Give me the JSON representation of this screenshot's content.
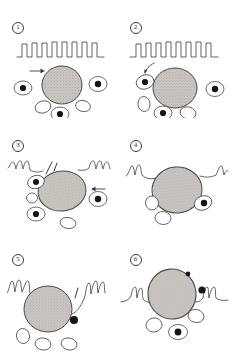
{
  "figure": {
    "type": "hand-drawn biological line illustration",
    "panel_count": 6,
    "grid": "2 columns x 3 rows",
    "background_color": "#ffffff",
    "ink_color": "#3c3a38",
    "cell_fill_color": "#c9c5c0",
    "nucleus_color": "#1a1a1a"
  },
  "panels": [
    {
      "id": "panel-1",
      "number_label": "1",
      "epithelium": {
        "present": true,
        "style": "crenellated",
        "position": "top",
        "teeth": 8,
        "note": "regular square-topped projections along a straight baseline"
      },
      "big_cell": {
        "present": true,
        "shape": "round",
        "texture": "stippled"
      },
      "arrow": {
        "present": true,
        "direction": "right",
        "position": "upper-left of big cell"
      },
      "small_cells": [
        {
          "position": "left",
          "nucleus": true
        },
        {
          "position": "right",
          "nucleus": true
        },
        {
          "position": "bottom-center",
          "nucleus": true
        }
      ],
      "blank_ovals": 2
    },
    {
      "id": "panel-2",
      "number_label": "2",
      "epithelium": {
        "present": true,
        "style": "crenellated",
        "position": "top",
        "teeth": 8,
        "note": "regular square-topped projections along a straight baseline"
      },
      "big_cell": {
        "present": true,
        "shape": "round",
        "texture": "stippled"
      },
      "arrow": {
        "present": true,
        "direction": "down-left curved",
        "position": "upper-left of big cell"
      },
      "small_cells": [
        {
          "position": "left-adjacent",
          "nucleus": true
        },
        {
          "position": "right",
          "nucleus": true
        },
        {
          "position": "bottom-center",
          "nucleus": true
        }
      ],
      "blank_ovals": 2
    },
    {
      "id": "panel-3",
      "number_label": "3",
      "epithelium": {
        "present": true,
        "style": "wavy-broken",
        "position": "flanking left and right",
        "teeth": 3,
        "note": "epithelium retracted to small ruffles either side of the cell"
      },
      "big_cell": {
        "present": true,
        "shape": "oval",
        "texture": "stippled"
      },
      "arrow": {
        "present": true,
        "direction": "left",
        "position": "right of big cell"
      },
      "small_cells": [
        {
          "position": "upper-left",
          "nucleus": true
        },
        {
          "position": "right",
          "nucleus": true
        },
        {
          "position": "lower-left",
          "nucleus": true
        }
      ],
      "blank_ovals": 2
    },
    {
      "id": "panel-4",
      "number_label": "4",
      "epithelium": {
        "present": true,
        "style": "wavy-flat",
        "position": "flanking left and right",
        "teeth": 3,
        "note": "epithelial sheet flattened against the cell on both sides"
      },
      "big_cell": {
        "present": true,
        "shape": "round",
        "texture": "stippled"
      },
      "arrow": {
        "present": false
      },
      "small_cells": [
        {
          "position": "right-adjacent",
          "nucleus": true
        }
      ],
      "blank_ovals": 2
    },
    {
      "id": "panel-5",
      "number_label": "5",
      "epithelium": {
        "present": true,
        "style": "wavy-ruffled",
        "position": "flanking left and right",
        "teeth": 3,
        "note": "epithelium drawn up around the embedded cell"
      },
      "big_cell": {
        "present": true,
        "shape": "round",
        "texture": "stippled"
      },
      "arrow": {
        "present": true,
        "direction": "up-right short stroke",
        "position": "right of big cell"
      },
      "small_cells": [
        {
          "position": "lower-right",
          "nucleus": true
        }
      ],
      "blank_ovals": 3
    },
    {
      "id": "panel-6",
      "number_label": "6",
      "epithelium": {
        "present": true,
        "style": "wavy-enclosing",
        "position": "flanking left and right, meeting over the cell",
        "teeth": 3,
        "note": "epithelium closed over the now-embedded cell"
      },
      "big_cell": {
        "present": true,
        "shape": "round",
        "texture": "stippled"
      },
      "arrow": {
        "present": false
      },
      "small_cells": [
        {
          "position": "right",
          "nucleus": true
        },
        {
          "position": "bottom-center",
          "nucleus": true
        }
      ],
      "blank_ovals": 2
    }
  ]
}
